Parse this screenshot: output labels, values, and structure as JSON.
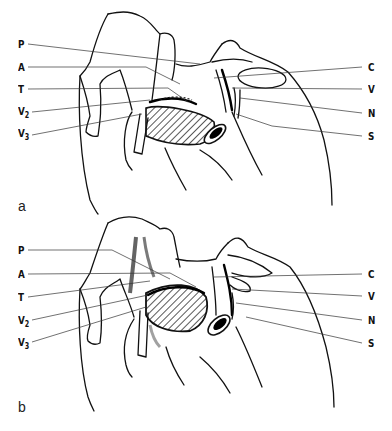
{
  "figure": {
    "panels": [
      {
        "id": "a",
        "panel_label": "a",
        "left_labels": [
          {
            "text": "P",
            "sub": ""
          },
          {
            "text": "A",
            "sub": ""
          },
          {
            "text": "T",
            "sub": ""
          },
          {
            "text": "V",
            "sub": "2"
          },
          {
            "text": "V",
            "sub": "3"
          }
        ],
        "right_labels": [
          {
            "text": "C"
          },
          {
            "text": "V"
          },
          {
            "text": "N"
          },
          {
            "text": "S"
          }
        ]
      },
      {
        "id": "b",
        "panel_label": "b",
        "left_labels": [
          {
            "text": "P",
            "sub": ""
          },
          {
            "text": "A",
            "sub": ""
          },
          {
            "text": "T",
            "sub": ""
          },
          {
            "text": "V",
            "sub": "2"
          },
          {
            "text": "V",
            "sub": "3"
          }
        ],
        "right_labels": [
          {
            "text": "C"
          },
          {
            "text": "V"
          },
          {
            "text": "N"
          },
          {
            "text": "S"
          }
        ]
      }
    ]
  },
  "colors": {
    "ink": "#111111",
    "background": "#ffffff"
  }
}
